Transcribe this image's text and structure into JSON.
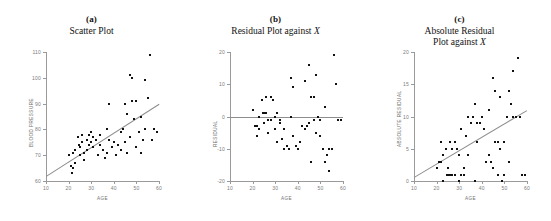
{
  "figure": {
    "panels": [
      {
        "caption": "(a)",
        "title": "Scatter Plot",
        "xlabel": "AGE",
        "ylabel": "BLOOD PRESSURE"
      },
      {
        "caption": "(b)",
        "title": "Residual Plot against X",
        "xlabel": "AGE",
        "ylabel": "RESIDUAL"
      },
      {
        "caption": "(c)",
        "title": "Absolute Residual\nPlot against X",
        "xlabel": "AGE",
        "ylabel": "ABSOLUTE RESIDUAL"
      }
    ],
    "colors": {
      "point": "#111111",
      "axis": "#9a9a9a",
      "fit_line": "#8d8d8d",
      "text": "#111111",
      "tick_text": "#7c7c7c"
    }
  },
  "chart_data": [
    {
      "type": "scatter",
      "title": "Scatter Plot",
      "caption": "(a)",
      "xlabel": "AGE",
      "ylabel": "BLOOD PRESSURE",
      "xlim": [
        10,
        60
      ],
      "ylim": [
        60,
        110
      ],
      "xticks": [
        10,
        20,
        30,
        40,
        50,
        60
      ],
      "yticks": [
        60,
        70,
        80,
        90,
        100,
        110
      ],
      "grid": false,
      "legend": null,
      "fit_line": {
        "type": "linear",
        "x": [
          10,
          60
        ],
        "y": [
          62.0,
          90.0
        ]
      },
      "x": [
        20,
        21,
        21.5,
        22,
        22,
        23,
        23,
        24,
        24.5,
        25,
        25,
        26,
        26,
        27,
        27,
        28,
        28,
        29,
        29,
        30,
        30,
        31,
        31,
        32,
        32,
        33,
        34,
        34,
        35,
        36,
        37,
        37,
        38,
        38,
        39,
        40,
        41,
        42,
        43,
        43,
        44,
        45,
        45,
        46,
        46,
        47,
        47,
        48,
        48,
        49,
        50,
        50,
        51,
        52,
        52,
        53,
        54,
        54,
        55,
        56,
        57,
        58,
        59
      ],
      "y": [
        70,
        66,
        63,
        65,
        71,
        72,
        67,
        77,
        74,
        73,
        70,
        78,
        75,
        71,
        68,
        76,
        72,
        78,
        74,
        79,
        75,
        77,
        73,
        76,
        76,
        70,
        78,
        74,
        72,
        69,
        80,
        71,
        90,
        76,
        73,
        75,
        70,
        74,
        79,
        72,
        80,
        90,
        75,
        86,
        71,
        101,
        77,
        100,
        91,
        84,
        73,
        91,
        79,
        71,
        85,
        76,
        99,
        80,
        92,
        109,
        76,
        80,
        79
      ]
    },
    {
      "type": "scatter",
      "title": "Residual Plot against X",
      "caption": "(b)",
      "xlabel": "AGE",
      "ylabel": "RESIDUAL",
      "xlim": [
        10,
        60
      ],
      "ylim": [
        -20,
        20
      ],
      "xticks": [
        10,
        20,
        30,
        40,
        50,
        60
      ],
      "yticks": [
        -20,
        -10,
        0,
        10,
        20
      ],
      "grid": false,
      "legend": null,
      "zero_line": 0,
      "x": [
        20,
        21,
        22,
        22,
        23,
        23,
        24,
        24.5,
        25,
        25,
        26,
        26,
        27,
        27,
        28,
        28,
        29,
        30,
        30,
        31,
        31,
        32,
        32,
        33,
        34,
        34,
        35,
        36,
        37,
        37,
        38,
        38,
        39,
        40,
        41,
        42,
        43,
        43,
        44,
        45,
        45,
        46,
        46,
        47,
        47,
        48,
        48,
        49,
        50,
        50,
        51,
        52,
        52,
        53,
        54,
        54,
        55,
        56,
        57,
        58,
        59
      ],
      "y": [
        2,
        -3,
        -3,
        -6,
        0,
        -4,
        5,
        1,
        1,
        -2,
        6,
        1,
        -1,
        -5,
        6,
        -1,
        5,
        0,
        -4,
        1,
        -8,
        -2,
        -1,
        -7,
        -4,
        -10,
        -9,
        -10,
        12,
        0,
        9,
        -6,
        -9,
        -10,
        -8,
        -3,
        11,
        -4,
        -3,
        16,
        -2,
        6,
        -14,
        6,
        -1,
        13,
        -5,
        0,
        -6,
        -1,
        -10,
        -14,
        3,
        -12,
        -17,
        -10,
        -10,
        19,
        10,
        -1,
        -1
      ]
    },
    {
      "type": "scatter",
      "title": "Absolute Residual Plot against X",
      "caption": "(c)",
      "xlabel": "AGE",
      "ylabel": "ABSOLUTE RESIDUAL",
      "xlim": [
        10,
        60
      ],
      "ylim": [
        0,
        20
      ],
      "xticks": [
        10,
        20,
        30,
        40,
        50,
        60
      ],
      "yticks": [
        0,
        5,
        10,
        15,
        20
      ],
      "grid": false,
      "legend": null,
      "fit_line": {
        "type": "linear",
        "x": [
          10,
          60
        ],
        "y": [
          0.6,
          11.0
        ]
      },
      "x": [
        20,
        21,
        22,
        22,
        23,
        23,
        24,
        24.5,
        25,
        25,
        26,
        26,
        27,
        27,
        28,
        28,
        29,
        30,
        30,
        31,
        31,
        32,
        32,
        33,
        34,
        34,
        35,
        36,
        37,
        37,
        38,
        38,
        39,
        40,
        41,
        42,
        43,
        43,
        44,
        45,
        45,
        46,
        46,
        47,
        47,
        48,
        48,
        49,
        50,
        50,
        51,
        52,
        52,
        53,
        54,
        54,
        55,
        56,
        57,
        58,
        59
      ],
      "y": [
        2,
        3,
        3,
        6,
        0,
        4,
        5,
        1,
        1,
        2,
        6,
        1,
        1,
        5,
        6,
        1,
        5,
        0,
        4,
        1,
        8,
        2,
        1,
        7,
        4,
        10,
        9,
        10,
        12,
        0,
        9,
        6,
        9,
        10,
        8,
        3,
        11,
        4,
        3,
        16,
        2,
        6,
        14,
        6,
        1,
        13,
        5,
        0,
        6,
        1,
        10,
        14,
        3,
        12,
        17,
        10,
        10,
        19,
        10,
        1,
        1
      ]
    }
  ]
}
